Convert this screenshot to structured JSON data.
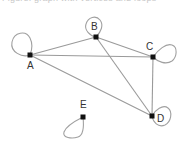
{
  "caption": "Figure: graph with vertices and loops",
  "graph": {
    "directed": false,
    "nodes": [
      {
        "id": "A",
        "label": "A"
      },
      {
        "id": "B",
        "label": "B"
      },
      {
        "id": "C",
        "label": "C"
      },
      {
        "id": "D",
        "label": "D"
      },
      {
        "id": "E",
        "label": "E"
      }
    ],
    "edges": [
      {
        "from": "A",
        "to": "B"
      },
      {
        "from": "A",
        "to": "C"
      },
      {
        "from": "A",
        "to": "D"
      },
      {
        "from": "B",
        "to": "C"
      },
      {
        "from": "B",
        "to": "D"
      },
      {
        "from": "C",
        "to": "D"
      }
    ],
    "loops": [
      "A",
      "B",
      "C",
      "D",
      "E"
    ]
  },
  "colors": {
    "edge": "#9a9a9a",
    "node": "#111111",
    "label": "#333333"
  }
}
